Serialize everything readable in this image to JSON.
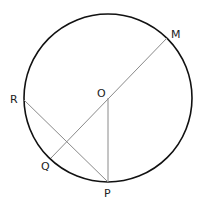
{
  "diagram": {
    "circle": {
      "center": "O",
      "cx": 108,
      "cy": 98,
      "r": 84
    },
    "points": {
      "M": {
        "label": "M",
        "x": 167,
        "y": 38
      },
      "O": {
        "label": "O",
        "x": 108,
        "y": 98
      },
      "R": {
        "label": "R",
        "x": 24,
        "y": 100
      },
      "Q": {
        "label": "Q",
        "x": 51,
        "y": 158
      },
      "P": {
        "label": "P",
        "x": 108,
        "y": 182
      }
    },
    "segments": [
      {
        "from": "M",
        "to": "Q"
      },
      {
        "from": "R",
        "to": "P"
      },
      {
        "from": "O",
        "to": "P"
      }
    ],
    "colors": {
      "circle": "#111111",
      "segment": "#8a8a8a",
      "label": "#222222"
    }
  }
}
